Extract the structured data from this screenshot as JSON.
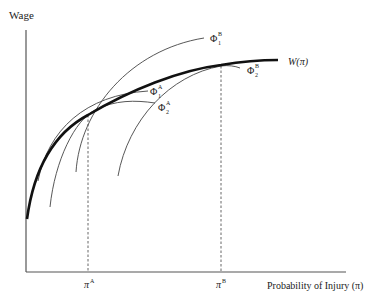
{
  "figure": {
    "y_axis_label": "Wage",
    "x_axis_label": "Probability of Injury (π)",
    "market_curve_label": "W(π)",
    "x_ticks": [
      {
        "base": "π",
        "sup": "A"
      },
      {
        "base": "π",
        "sup": "B"
      }
    ],
    "indifference_curves": [
      {
        "base": "Φ",
        "sub": "1",
        "sup": "A"
      },
      {
        "base": "Φ",
        "sub": "2",
        "sup": "A"
      },
      {
        "base": "Φ",
        "sub": "1",
        "sup": "B"
      },
      {
        "base": "Φ",
        "sub": "2",
        "sup": "B"
      }
    ],
    "colors": {
      "axis": "#555555",
      "market_curve": "#111111",
      "indifference": "#444444",
      "guide": "#555555"
    }
  }
}
